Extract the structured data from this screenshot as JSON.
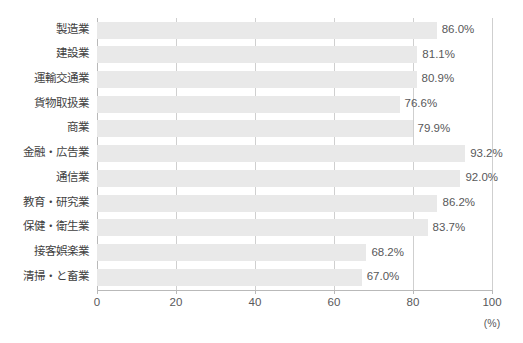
{
  "chart_data": {
    "type": "bar",
    "orientation": "horizontal",
    "title": "",
    "xlabel": "(%)",
    "ylabel": "",
    "xlim": [
      0,
      100
    ],
    "ticks": [
      "0",
      "20",
      "40",
      "60",
      "80",
      "100"
    ],
    "tick_values": [
      0,
      20,
      40,
      60,
      80,
      100
    ],
    "grid": true,
    "legend": null,
    "categories": [
      "製造業",
      "建設業",
      "運輸交通業",
      "貨物取扱業",
      "商業",
      "金融・広告業",
      "通信業",
      "教育・研究業",
      "保健・衛生業",
      "接客娯楽業",
      "清掃・と畜業"
    ],
    "values": [
      86.0,
      81.1,
      80.9,
      76.6,
      79.9,
      93.2,
      92.0,
      86.2,
      83.7,
      68.2,
      67.0
    ],
    "value_labels": [
      "86.0%",
      "81.1%",
      "80.9%",
      "76.6%",
      "79.9%",
      "93.2%",
      "92.0%",
      "86.2%",
      "83.7%",
      "68.2%",
      "67.0%"
    ],
    "bar_color": "#e9e9e9",
    "axis_color": "#b9b9b9",
    "grid_color": "#cfcfcf",
    "text_color": "#58585a"
  }
}
